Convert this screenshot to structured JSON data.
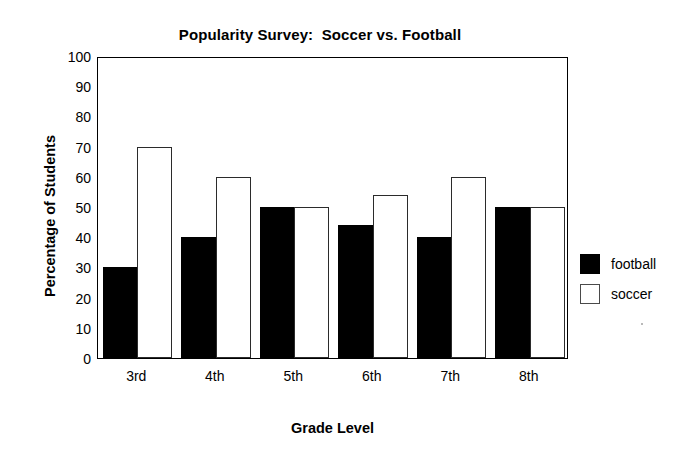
{
  "chart_data": {
    "type": "bar",
    "title": "Popularity Survey:  Soccer vs. Football",
    "xlabel": "Grade Level",
    "ylabel": "Percentage of Students",
    "categories": [
      "3rd",
      "4th",
      "5th",
      "6th",
      "7th",
      "8th"
    ],
    "series": [
      {
        "name": "football",
        "color": "#000000",
        "values": [
          30,
          40,
          50,
          44,
          40,
          50
        ]
      },
      {
        "name": "soccer",
        "color": "#ffffff",
        "values": [
          70,
          60,
          50,
          54,
          60,
          50
        ]
      }
    ],
    "ylim": [
      0,
      100
    ],
    "yticks": [
      0,
      10,
      20,
      30,
      40,
      50,
      60,
      70,
      80,
      90,
      100
    ],
    "ytick_labels": [
      "0",
      "10",
      "20",
      "30",
      "40",
      "50",
      "60",
      "70",
      "80",
      "90",
      "100"
    ],
    "grid": false,
    "legend_position": "right",
    "legend_entries": [
      "football",
      "soccer"
    ],
    "axis_color": "#000000",
    "background": "#ffffff"
  },
  "legend": {
    "items": [
      {
        "label": "football",
        "swatch": "black-filled-square"
      },
      {
        "label": "soccer",
        "swatch": "white-outlined-square"
      }
    ]
  }
}
